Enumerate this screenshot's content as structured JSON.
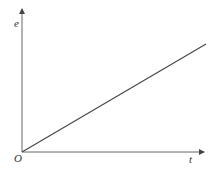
{
  "diagram": {
    "type": "line-graph",
    "y_axis_label": "e",
    "x_axis_label": "t",
    "origin_label": "O",
    "line": {
      "from": [
        0,
        0
      ],
      "to": [
        1,
        1
      ],
      "description": "straight line through origin with positive slope"
    },
    "colors": {
      "axis": "#555555",
      "line": "#444444"
    }
  }
}
